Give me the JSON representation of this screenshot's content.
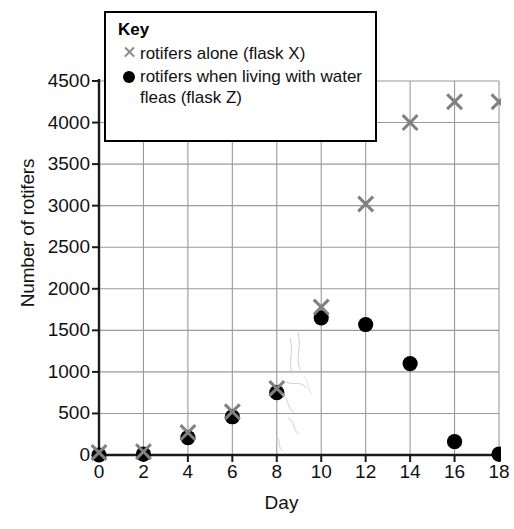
{
  "chart_data": {
    "type": "scatter",
    "title": "",
    "xlabel": "Day",
    "ylabel": "Number of rotifers",
    "xlim": [
      0,
      18
    ],
    "ylim": [
      0,
      4500
    ],
    "x_ticks": [
      0,
      2,
      4,
      6,
      8,
      10,
      12,
      14,
      16,
      18
    ],
    "y_ticks": [
      0,
      500,
      1000,
      1500,
      2000,
      2500,
      3000,
      3500,
      4000,
      4500
    ],
    "grid": true,
    "legend_position": "top-center-inside",
    "x": [
      0,
      2,
      4,
      6,
      8,
      10,
      12,
      14,
      16,
      18
    ],
    "series": [
      {
        "name": "rotifers alone (flask X)",
        "marker": "cross",
        "color": "#808080",
        "values": [
          30,
          40,
          270,
          520,
          800,
          1780,
          3020,
          4000,
          4250,
          4250
        ]
      },
      {
        "name": "rotifers when living with water fleas (flask Z)",
        "marker": "circle",
        "color": "#000000",
        "values": [
          0,
          10,
          210,
          460,
          750,
          1650,
          1570,
          1100,
          160,
          10
        ]
      }
    ]
  },
  "axes": {
    "y_title": "Number of rotifers",
    "x_title": "Day",
    "y_tick_labels": [
      "0",
      "500",
      "1000",
      "1500",
      "2000",
      "2500",
      "3000",
      "3500",
      "4000",
      "4500"
    ],
    "x_tick_labels": [
      "0",
      "2",
      "4",
      "6",
      "8",
      "10",
      "12",
      "14",
      "16",
      "18"
    ]
  },
  "legend": {
    "title": "Key",
    "entries": [
      {
        "marker": "cross-marker",
        "label": "rotifers alone (flask X)",
        "color": "#808080"
      },
      {
        "marker": "dot-marker",
        "label": "rotifers when living with water fleas (flask Z)",
        "color": "#000000"
      }
    ]
  },
  "style": {
    "gridline_color": "#9a9a9a",
    "axis_color": "#1a1a1a",
    "background": "#ffffff"
  }
}
